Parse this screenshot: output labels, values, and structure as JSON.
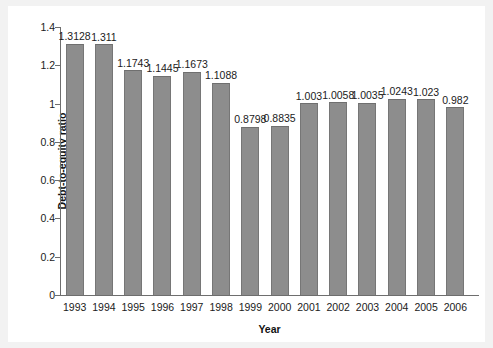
{
  "chart_data": {
    "type": "bar",
    "title": "",
    "xlabel": "Year",
    "ylabel": "Debt-to-equity ratio",
    "categories": [
      "1993",
      "1994",
      "1995",
      "1996",
      "1997",
      "1998",
      "1999",
      "2000",
      "2001",
      "2002",
      "2003",
      "2004",
      "2005",
      "2006"
    ],
    "values": [
      1.3128,
      1.311,
      1.1743,
      1.1445,
      1.1673,
      1.1088,
      0.8798,
      0.8835,
      1.003,
      1.0058,
      1.0035,
      1.0243,
      1.023,
      0.982
    ],
    "value_labels": [
      "1.3128",
      "1.311",
      "1.1743",
      "1.1445",
      "1.1673",
      "1.1088",
      "0.8798",
      "0.8835",
      "1.003",
      "1.0058",
      "1.0035",
      "1.0243",
      "1.023",
      "0.982"
    ],
    "ylim": [
      0,
      1.4
    ],
    "yticks": [
      0,
      0.2,
      0.4,
      0.6,
      0.8,
      1,
      1.2,
      1.4
    ],
    "ytick_labels": [
      "0",
      "0.2",
      "0.4",
      "0.6",
      "0.8",
      "1",
      "1.2",
      "1.4"
    ],
    "grid": false,
    "legend": null,
    "bar_color": "#8d8d8d",
    "axis_color": "#6e6e6e",
    "background": "#ffffff"
  }
}
